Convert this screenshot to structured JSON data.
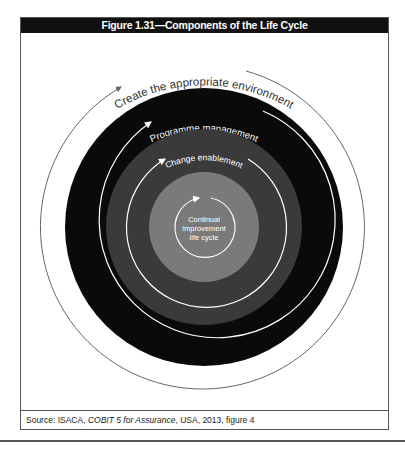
{
  "figure": {
    "title": "Figure 1.31—Components of the Life Cycle",
    "rings": [
      {
        "label": "Create the appropriate environment",
        "fill": "#ffffff",
        "arc_color": "#666666"
      },
      {
        "label": "Programme management",
        "fill": "#0a0a0a",
        "arc_color": "#ffffff"
      },
      {
        "label": "Change enablement",
        "fill": "#3a3a3a",
        "arc_color": "#ffffff"
      },
      {
        "label_lines": [
          "Continual",
          "improvement",
          "life cycle"
        ],
        "fill": "#7a7a7a",
        "arc_color": "#ffffff"
      }
    ]
  },
  "source": {
    "prefix": "Source:  ISACA, ",
    "title": "COBIT 5 for Assurance",
    "suffix": ", USA, 2013, figure 4"
  }
}
